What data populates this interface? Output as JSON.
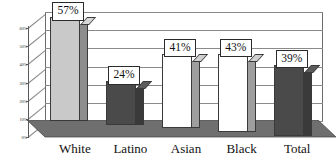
{
  "chart_data": {
    "type": "bar",
    "title": "",
    "subtitle": "",
    "xlabel": "",
    "ylabel": "",
    "categories": [
      "White",
      "Latino",
      "Asian",
      "Black",
      "Total"
    ],
    "values": [
      57,
      24,
      41,
      43,
      39
    ],
    "value_labels": [
      "57%",
      "24%",
      "41%",
      "43%",
      "39%"
    ],
    "ylim": [
      0,
      60
    ],
    "ytick_values": [
      0,
      10,
      20,
      30,
      40,
      50,
      60
    ],
    "ytick_labels": [
      "0%",
      "10%",
      "20%",
      "30%",
      "40%",
      "50%",
      "60%"
    ],
    "grid": true,
    "legend": false,
    "legend_position": "none",
    "style": "3d-columns-grayscale",
    "series": [
      {
        "name": "percent",
        "values": [
          57,
          24,
          41,
          43,
          39
        ]
      }
    ],
    "bar_fills": [
      "#c9c9c9",
      "#4a4a4a",
      "#ffffff",
      "#ffffff",
      "#4a4a4a"
    ],
    "bar_side_fills": [
      "#8d8d8d",
      "#3a3a3a",
      "#9e9e9e",
      "#9e9e9e",
      "#3a3a3a"
    ],
    "bar_top_fills": [
      "#d8d8d8",
      "#5c5c5c",
      "#d0d0d0",
      "#d0d0d0",
      "#5c5c5c"
    ]
  },
  "colors": {
    "background": "#ffffff",
    "axis": "#5a5a5a",
    "grid": "#8a8a8a",
    "floor": "#6f6f6f",
    "floor_front": "#b8b8b8",
    "text": "#111111",
    "bar_outline": "#3a3a3a"
  }
}
